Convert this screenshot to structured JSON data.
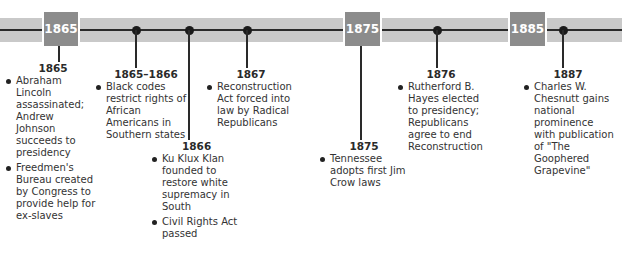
{
  "timeline": {
    "decade_markers": [
      {
        "label": "1865"
      },
      {
        "label": "1875"
      },
      {
        "label": "1885"
      }
    ],
    "events": [
      {
        "year": "1865",
        "items": [
          "Abraham Lincoln assassinated; Andrew Johnson succeeds to presidency",
          "Freedmen's Bureau created by Congress to provide help for ex-slaves"
        ]
      },
      {
        "year": "1865–1866",
        "items": [
          "Black codes restrict rights of African Americans in Southern states"
        ]
      },
      {
        "year": "1866",
        "items": [
          "Ku Klux Klan founded to restore white supremacy in South",
          "Civil Rights Act passed"
        ]
      },
      {
        "year": "1867",
        "items": [
          "Reconstruction Act forced into law by Radical Republicans"
        ]
      },
      {
        "year": "1875",
        "items": [
          "Tennessee adopts first Jim Crow laws"
        ]
      },
      {
        "year": "1876",
        "items": [
          "Rutherford B. Hayes elected to presidency; Republicans agree to end Reconstruction"
        ]
      },
      {
        "year": "1887",
        "items": [
          "Charles W. Chesnutt gains national prominence with publication of \"The Goophered Grapevine\""
        ]
      }
    ]
  },
  "colors": {
    "band": "#c9c9c9",
    "year_box": "#8c8c8c",
    "line": "#2a2a2a"
  }
}
